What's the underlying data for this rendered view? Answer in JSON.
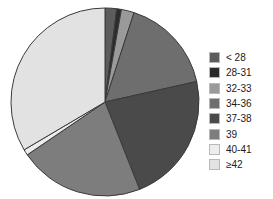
{
  "chart_data": {
    "type": "pie",
    "title": "",
    "legend_position": "right",
    "grid": false,
    "categories": [
      "< 28",
      "28-31",
      "32-33",
      "34-36",
      "37-38",
      "39",
      "40-41",
      "≥42"
    ],
    "values": [
      2.0,
      0.8,
      2.2,
      16.5,
      22.5,
      21.5,
      1.0,
      33.5
    ],
    "colors": [
      "#5c5c5c",
      "#2b2b2b",
      "#9a9a9a",
      "#6e6e6e",
      "#4a4a4a",
      "#7d7d7d",
      "#ededed",
      "#e2e2e2"
    ],
    "start_angle": 90,
    "direction": "clockwise",
    "xlabel": "",
    "ylabel": ""
  },
  "legend": {
    "items": [
      {
        "label": "< 28",
        "color": "#5c5c5c"
      },
      {
        "label": "28-31",
        "color": "#2b2b2b"
      },
      {
        "label": "32-33",
        "color": "#9a9a9a"
      },
      {
        "label": "34-36",
        "color": "#6e6e6e"
      },
      {
        "label": "37-38",
        "color": "#4a4a4a"
      },
      {
        "label": "39",
        "color": "#7d7d7d"
      },
      {
        "label": "40-41",
        "color": "#ededed"
      },
      {
        "label": "≥42",
        "color": "#e2e2e2"
      }
    ]
  },
  "pie": {
    "center_x": 96,
    "center_y": 96,
    "radius": 94,
    "outline_color": "#3a3a3a"
  }
}
